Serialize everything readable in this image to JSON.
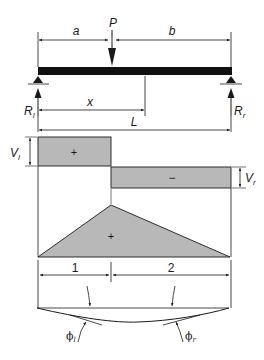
{
  "diagram": {
    "colors": {
      "ink": "#1a1a1a",
      "fill_gray": "#b8b8b8",
      "beam": "#111111",
      "background": "#ffffff"
    },
    "load": {
      "label": "P",
      "dim_a": "a",
      "dim_b": "b",
      "dim_x": "x",
      "dim_L": "L",
      "reaction_left": "R",
      "reaction_left_sub": "l",
      "reaction_right": "R",
      "reaction_right_sub": "r"
    },
    "shear": {
      "left_label": "V",
      "left_sub": "l",
      "right_label": "V",
      "right_sub": "r",
      "positive_sign": "+",
      "negative_sign": "−"
    },
    "moment": {
      "sign": "+",
      "segment_1": "1",
      "segment_2": "2"
    },
    "deflection": {
      "slope_left": "ϕ",
      "slope_left_sub": "l",
      "slope_right": "ϕ",
      "slope_right_sub": "r"
    }
  }
}
